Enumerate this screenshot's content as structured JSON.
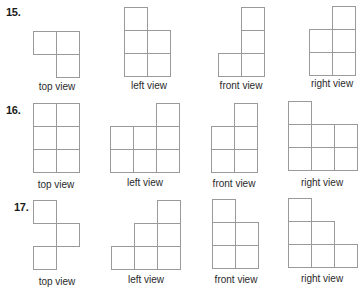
{
  "problems": [
    {
      "number": "15.",
      "views": [
        {
          "label": "top view",
          "cells": [
            [
              0,
              0
            ],
            [
              1,
              0
            ],
            [
              1,
              1
            ]
          ]
        },
        {
          "label": "left view",
          "cells": [
            [
              0,
              0
            ],
            [
              0,
              1
            ],
            [
              1,
              1
            ],
            [
              0,
              2
            ],
            [
              1,
              2
            ]
          ]
        },
        {
          "label": "front view",
          "cells": [
            [
              1,
              0
            ],
            [
              1,
              1
            ],
            [
              0,
              2
            ],
            [
              1,
              2
            ]
          ]
        },
        {
          "label": "right view",
          "cells": [
            [
              1,
              0
            ],
            [
              0,
              1
            ],
            [
              1,
              1
            ],
            [
              0,
              2
            ],
            [
              1,
              2
            ]
          ]
        }
      ]
    },
    {
      "number": "16.",
      "views": [
        {
          "label": "top view",
          "cells": [
            [
              0,
              0
            ],
            [
              1,
              0
            ],
            [
              0,
              1
            ],
            [
              1,
              1
            ],
            [
              0,
              2
            ],
            [
              1,
              2
            ]
          ]
        },
        {
          "label": "left view",
          "cells": [
            [
              2,
              0
            ],
            [
              0,
              1
            ],
            [
              1,
              1
            ],
            [
              2,
              1
            ],
            [
              0,
              2
            ],
            [
              1,
              2
            ],
            [
              2,
              2
            ]
          ]
        },
        {
          "label": "front view",
          "cells": [
            [
              1,
              0
            ],
            [
              0,
              1
            ],
            [
              1,
              1
            ],
            [
              0,
              2
            ],
            [
              1,
              2
            ]
          ]
        },
        {
          "label": "right view",
          "cells": [
            [
              0,
              0
            ],
            [
              0,
              1
            ],
            [
              1,
              1
            ],
            [
              2,
              1
            ],
            [
              0,
              2
            ],
            [
              1,
              2
            ],
            [
              2,
              2
            ]
          ]
        }
      ]
    },
    {
      "number": "17.",
      "views": [
        {
          "label": "top view",
          "cells": [
            [
              0,
              0
            ],
            [
              1,
              1
            ],
            [
              0,
              2
            ]
          ]
        },
        {
          "label": "left view",
          "cells": [
            [
              2,
              0
            ],
            [
              1,
              1
            ],
            [
              2,
              1
            ],
            [
              0,
              2
            ],
            [
              1,
              2
            ],
            [
              2,
              2
            ]
          ]
        },
        {
          "label": "front view",
          "cells": [
            [
              0,
              0
            ],
            [
              0,
              1
            ],
            [
              1,
              1
            ],
            [
              0,
              2
            ],
            [
              1,
              2
            ]
          ]
        },
        {
          "label": "right view",
          "cells": [
            [
              0,
              0
            ],
            [
              0,
              1
            ],
            [
              1,
              1
            ],
            [
              0,
              2
            ],
            [
              1,
              2
            ],
            [
              2,
              2
            ]
          ]
        }
      ]
    }
  ]
}
